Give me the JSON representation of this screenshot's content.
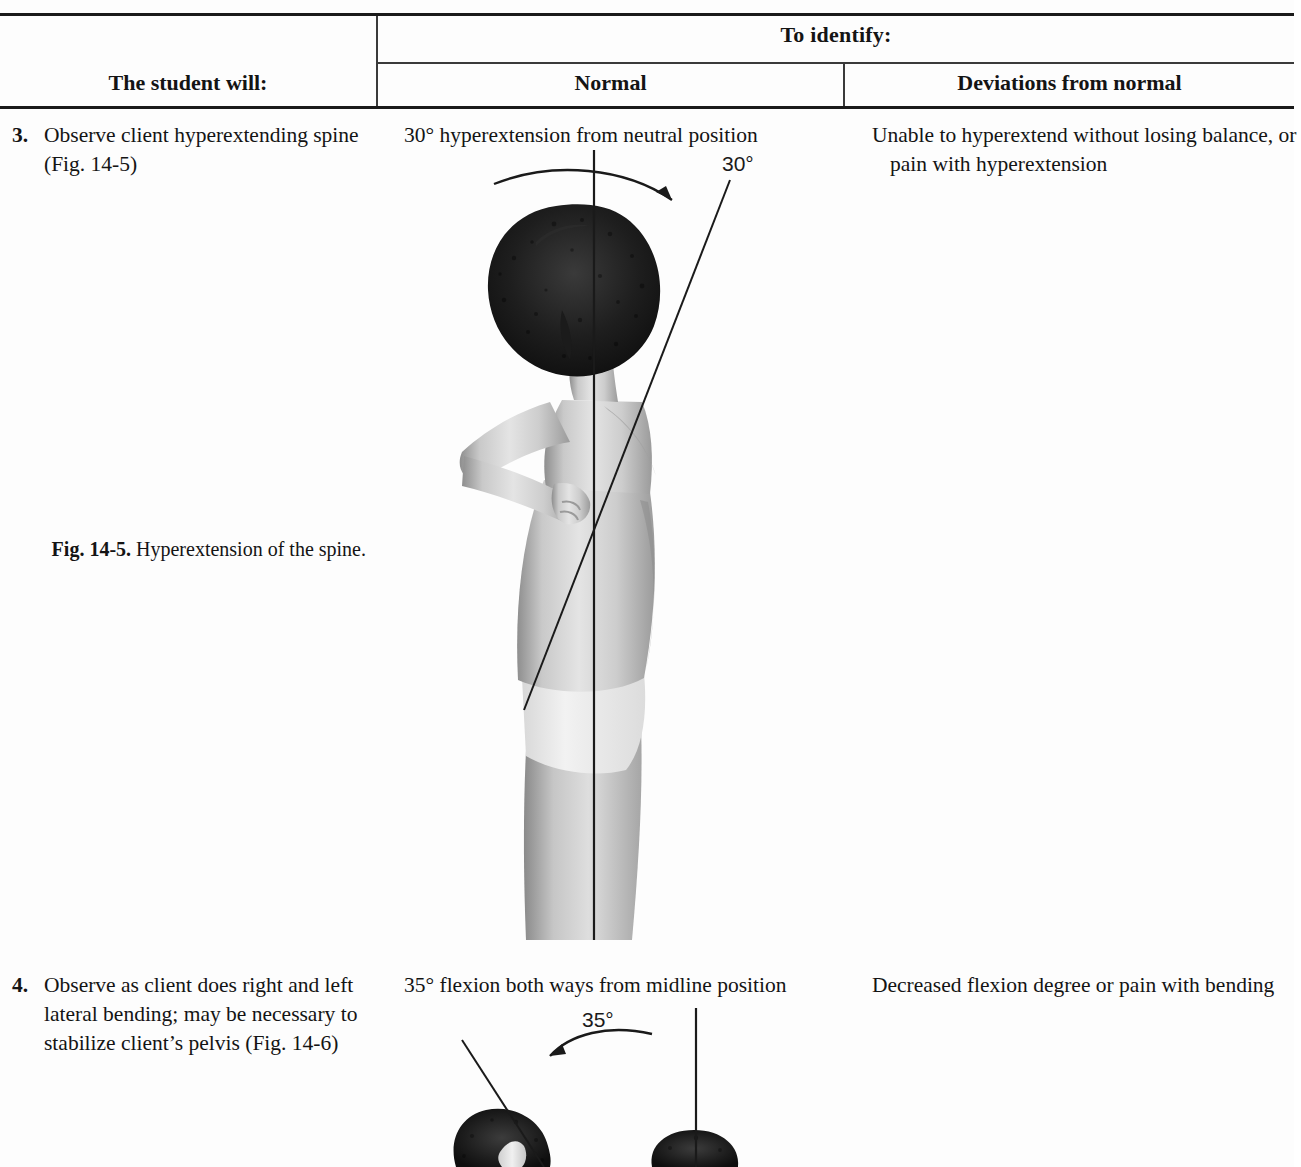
{
  "document": {
    "type": "textbook-assessment-table",
    "background_color": "#fdfdfd",
    "text_color": "#141414"
  },
  "table": {
    "headers": {
      "group_header": "To identify:",
      "col_task": "The student will:",
      "col_normal": "Normal",
      "col_deviations": "Deviations from normal"
    },
    "rows": [
      {
        "number": "3.",
        "task": "Observe client hyperextending spine (Fig. 14-5)",
        "normal": "30° hyperextension from neutral position",
        "deviations": "Unable to hyperextend without losing balance, or pain with hyperextension"
      },
      {
        "number": "4.",
        "task": "Observe as client does right and left lateral bending; may be necessary to stabilize client’s pelvis (Fig. 14-6)",
        "normal": "35° flexion both ways from midline position",
        "deviations": "Decreased flexion degree or pain with bending"
      }
    ]
  },
  "figures": [
    {
      "id": "fig-14-5",
      "caption_label": "Fig. 14-5.",
      "caption_text": "Hyperextension of the spine.",
      "angle_label": "30°",
      "description": "Black and white photograph, side view of a standing man with arms folded, leaning backward; a vertical reference line and an angled line show the hyperextension angle."
    },
    {
      "id": "fig-14-6",
      "angle_label": "35°",
      "description": "Black and white photograph, rear view of a person bending laterally; a vertical reference line and an angled line show the lateral flexion angle."
    }
  ]
}
